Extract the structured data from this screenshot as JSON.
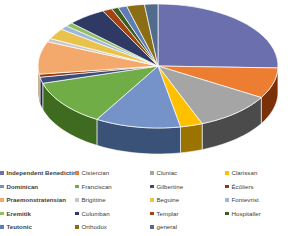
{
  "chart_data": {
    "type": "pie",
    "title": "",
    "subtitle": "",
    "xlabel": "",
    "ylabel": "",
    "grid": false,
    "three_d": true,
    "legend_position": "bottom",
    "legend_columns": 4,
    "start_angle_deg": -90,
    "direction": "clockwise",
    "categories": [
      "Independent Benedictine",
      "Cistercian",
      "Cluniac",
      "Clarissan",
      "Dominican",
      "Franciscan",
      "Gilbertine",
      "Écôliers",
      "Praemonstratensian",
      "Brigittine",
      "Beguine",
      "Fontevrist",
      "Eremitik",
      "Columban",
      "Templar",
      "Hospitaller",
      "Teutonic",
      "Orthodox",
      "general"
    ],
    "values": [
      25.5,
      8.0,
      10.5,
      3.0,
      11.5,
      12.0,
      1.6,
      0.8,
      8.5,
      0.9,
      2.8,
      1.1,
      1.0,
      5.2,
      1.3,
      0.9,
      1.2,
      2.4,
      1.8
    ],
    "colors": [
      "#6B6FAE",
      "#ED7D31",
      "#A5A5A5",
      "#FFC000",
      "#7593C8",
      "#70AD47",
      "#3A4C7A",
      "#8C3B10",
      "#F3A96B",
      "#C8C8C8",
      "#E8C24A",
      "#9DB7DD",
      "#8FBF62",
      "#2E3A63",
      "#A34410",
      "#3E5E1F",
      "#5E7CB5",
      "#8A6D14",
      "#516B8C"
    ],
    "side_colors": [
      "#1F2250",
      "#7A3109",
      "#4B4B4B",
      "#9A7300",
      "#3B5278",
      "#3E6B20",
      "#1C2740",
      "#4D1E06",
      "#A06528",
      "#6E6E6E",
      "#8E7320",
      "#5A6D8C",
      "#4F7430",
      "#171E35",
      "#5C2608",
      "#22370F",
      "#344A6D",
      "#4D3C06",
      "#2C3C51"
    ]
  },
  "legend": {
    "columns": [
      [
        {
          "label": "Independent Benedictine",
          "color": "#6B6FAE"
        },
        {
          "label": "Dominican",
          "color": "#7593C8"
        },
        {
          "label": "Praemonstratensian",
          "color": "#F3A96B"
        },
        {
          "label": "Eremitik",
          "color": "#8FBF62"
        },
        {
          "label": "Teutonic",
          "color": "#5E7CB5"
        }
      ],
      [
        {
          "label": "Cistercian",
          "color": "#ED7D31"
        },
        {
          "label": "Franciscan",
          "color": "#70AD47"
        },
        {
          "label": "Brigittine",
          "color": "#C8C8C8"
        },
        {
          "label": "Columban",
          "color": "#2E3A63"
        },
        {
          "label": "Orthodox",
          "color": "#8A6D14"
        }
      ],
      [
        {
          "label": "Cluniac",
          "color": "#A5A5A5"
        },
        {
          "label": "Gilbertine",
          "color": "#3A4C7A"
        },
        {
          "label": "Beguine",
          "color": "#E8C24A"
        },
        {
          "label": "Templar",
          "color": "#A34410"
        },
        {
          "label": "general",
          "color": "#516B8C"
        }
      ],
      [
        {
          "label": "Clarissan",
          "color": "#FFC000"
        },
        {
          "label": "Écôliers",
          "color": "#8C3B10"
        },
        {
          "label": "Fontevrist",
          "color": "#9DB7DD"
        },
        {
          "label": "Hospitaller",
          "color": "#3E5E1F"
        }
      ]
    ]
  }
}
